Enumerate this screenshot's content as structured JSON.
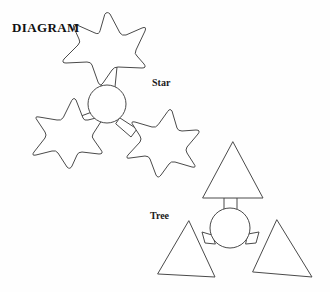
{
  "page": {
    "title": "DIAGRAM",
    "background_color": "#fefefe",
    "width": 330,
    "height": 292
  },
  "style": {
    "stroke_color": "#4a4a4a",
    "fill_color": "#ffffff",
    "text_color": "#111111",
    "stroke_width": 1
  },
  "labels": {
    "diagram_title": "DIAGRAM",
    "star_group": "Star",
    "tree_group": "Tree"
  },
  "groups": [
    {
      "name": "star-group",
      "label": "Star",
      "hub": {
        "cx": 107,
        "cy": 104,
        "r": 19
      },
      "node_shape": "star",
      "node_count": 3,
      "nodes": [
        {
          "position": "top",
          "cx": 112,
          "cy": 41
        },
        {
          "position": "bottom-left",
          "cx": 65,
          "cy": 129
        },
        {
          "position": "bottom-right",
          "cx": 162,
          "cy": 138
        }
      ]
    },
    {
      "name": "tree-group",
      "label": "Tree",
      "hub": {
        "cx": 230,
        "cy": 228,
        "r": 20
      },
      "node_shape": "triangle",
      "node_count": 3,
      "nodes": [
        {
          "position": "top",
          "cx": 233,
          "cy": 172
        },
        {
          "position": "bottom-left",
          "cx": 186,
          "cy": 250
        },
        {
          "position": "bottom-right",
          "cx": 282,
          "cy": 250
        }
      ]
    }
  ],
  "icons": {
    "star": "star-icon",
    "triangle": "triangle-icon",
    "circle": "circle-icon"
  }
}
